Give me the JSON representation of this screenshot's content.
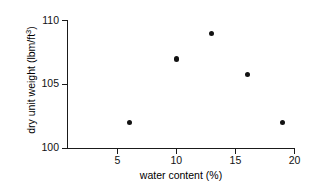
{
  "chart_data": {
    "type": "scatter",
    "title": "",
    "xlabel": "water content (%)",
    "ylabel": "dry unit weight (lbm/ft",
    "ylabel_sup": "3",
    "ylabel_suffix": ")",
    "xlim": [
      0.8,
      20
    ],
    "ylim": [
      100,
      110
    ],
    "xticks": [
      5,
      10,
      15,
      20
    ],
    "yticks": [
      100,
      105,
      110
    ],
    "xticklabels": [
      "5",
      "10",
      "15",
      "20"
    ],
    "yticklabels": [
      "100",
      "105",
      "110"
    ],
    "grid": false,
    "legend": null,
    "marker": "filled-circle",
    "marker_color": "#121212",
    "axis_color": "#1a1a1a",
    "background": "#ffffff",
    "x": [
      6,
      10,
      13,
      16,
      19
    ],
    "y": [
      102,
      107,
      109,
      105.8,
      102
    ],
    "points": [
      {
        "x": 6,
        "y": 102
      },
      {
        "x": 10,
        "y": 107
      },
      {
        "x": 13,
        "y": 109
      },
      {
        "x": 16,
        "y": 105.8
      },
      {
        "x": 19,
        "y": 102
      }
    ]
  }
}
